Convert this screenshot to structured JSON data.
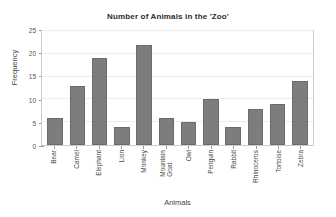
{
  "chart_data": {
    "type": "bar",
    "title": "Number of Animals in the 'Zoo'",
    "xlabel": "Animals",
    "ylabel": "Frequency",
    "categories": [
      "Bear",
      "Camel",
      "Elephant",
      "Lion",
      "Monkey",
      "Mountain\nGoat",
      "Owl",
      "Penguin",
      "Rabbit",
      "Rhinoceros",
      "Tortoise",
      "Zebra"
    ],
    "values": [
      6,
      13,
      19,
      4,
      22,
      6,
      5,
      10,
      4,
      8,
      9,
      14
    ],
    "ylim": [
      0,
      25
    ],
    "ytick_labels": [
      "0",
      "5",
      "10",
      "15",
      "20",
      "25"
    ],
    "ytick_values": [
      0,
      5,
      10,
      15,
      20,
      25
    ],
    "y_minor_tick_step": 1,
    "grid": "horizontal",
    "legend": "none",
    "bar_color": "#7d7d7d",
    "bar_edge_color": "#6b6b6b",
    "gridline_color": "#ededed",
    "frame_color": "#cccccc",
    "background_color": "#ffffff"
  }
}
